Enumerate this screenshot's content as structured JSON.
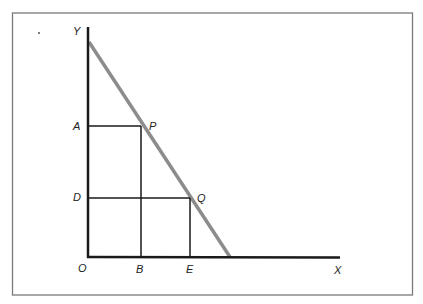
{
  "diagram": {
    "type": "geometric construction on axes",
    "colors": {
      "frame": "#7a7a7a",
      "axis": "#1a1a1a",
      "line": "#1a1a1a",
      "diagonal": "#8c8c8c",
      "text": "#222222"
    },
    "labels": {
      "y_axis": "Y",
      "x_axis": "X",
      "origin": "O",
      "a": "A",
      "p": "P",
      "d": "D",
      "q": "Q",
      "b": "B",
      "e": "E"
    },
    "points": {
      "O": [
        88,
        257
      ],
      "Y_top": [
        88,
        27
      ],
      "X_end": [
        340,
        257
      ],
      "diag_start": [
        89,
        42
      ],
      "diag_end": [
        230,
        257
      ],
      "A": [
        88,
        126
      ],
      "P": [
        141,
        126
      ],
      "D": [
        88,
        198
      ],
      "Q": [
        190,
        198
      ],
      "B": [
        141,
        257
      ],
      "E": [
        190,
        257
      ]
    },
    "stray_mark": "."
  }
}
